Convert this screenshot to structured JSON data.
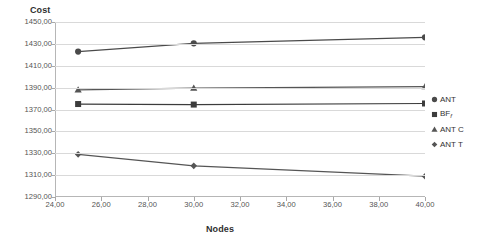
{
  "chart_data": {
    "type": "line",
    "title": "",
    "xlabel": "Nodes",
    "ylabel": "Cost",
    "x": [
      25,
      30,
      40
    ],
    "xlim": [
      24,
      40
    ],
    "ylim": [
      1290,
      1450
    ],
    "grid": true,
    "legend_position": "right",
    "x_ticks": [
      "24,00",
      "26,00",
      "28,00",
      "30,00",
      "32,00",
      "34,00",
      "36,00",
      "38,00",
      "40,00"
    ],
    "x_tick_values": [
      24,
      26,
      28,
      30,
      32,
      34,
      36,
      38,
      40
    ],
    "y_ticks": [
      "1290,00",
      "1310,00",
      "1330,00",
      "1350,00",
      "1370,00",
      "1390,00",
      "1410,00",
      "1430,00",
      "1450,00"
    ],
    "y_tick_values": [
      1290,
      1310,
      1330,
      1350,
      1370,
      1390,
      1410,
      1430,
      1450
    ],
    "series": [
      {
        "name": "ANT",
        "marker": "circle",
        "color": "#4a4a4a",
        "values": [
          1423.0,
          1430.5,
          1436.0
        ]
      },
      {
        "name": "BF_f",
        "label": "BF",
        "label_sub": "f",
        "marker": "square",
        "color": "#3c3c3c",
        "values": [
          1375.0,
          1374.5,
          1375.5
        ]
      },
      {
        "name": "ANT C",
        "marker": "triangle",
        "color": "#555555",
        "values": [
          1388.0,
          1389.5,
          1391.0
        ]
      },
      {
        "name": "ANT T",
        "marker": "diamond",
        "color": "#555555",
        "values": [
          1329.0,
          1318.5,
          1309.0
        ]
      }
    ]
  },
  "legend": {
    "items": [
      {
        "label": "ANT"
      },
      {
        "label": "BF",
        "sub": "f"
      },
      {
        "label": "ANT C"
      },
      {
        "label": "ANT T"
      }
    ]
  },
  "axis": {
    "y_title": "Cost",
    "x_title": "Nodes"
  }
}
